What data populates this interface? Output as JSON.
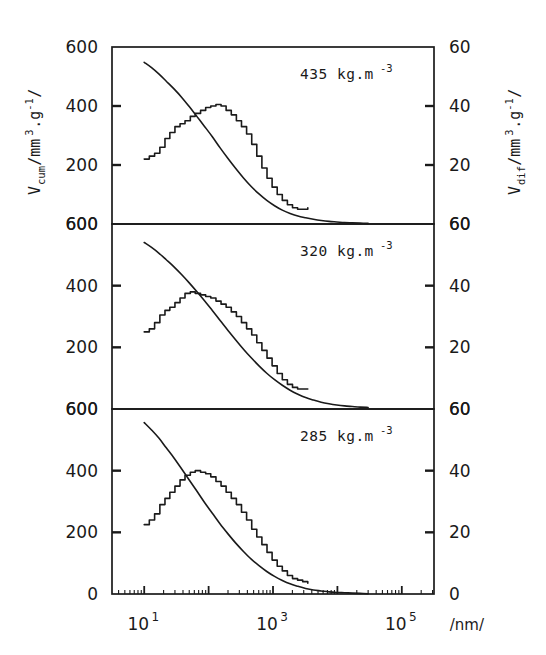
{
  "figure": {
    "axis_titles": {
      "left_main": "V",
      "left_sub": "cum",
      "left_rest": "/mm",
      "left_exp3": "3",
      "left_dot_g": ".g",
      "left_expm1": "-1",
      "left_tail": "/",
      "right_main": "V",
      "right_sub": "dif",
      "right_rest": "/mm",
      "right_exp3": "3",
      "right_dot_g": ".g",
      "right_expm1": "-1",
      "right_tail": "/",
      "x_unit": "/nm/"
    },
    "x_tick_labels": [
      {
        "mantissa": "10",
        "exponent": "1",
        "value": 10
      },
      {
        "mantissa": "10",
        "exponent": "3",
        "value": 1000
      },
      {
        "mantissa": "10",
        "exponent": "5",
        "value": 100000
      }
    ],
    "panels": [
      {
        "id": "panel-435",
        "annotation_value": "435",
        "annotation_unit": "kg.m",
        "annotation_exponent": "-3",
        "left_ticks": [
          "600",
          "400",
          "200"
        ],
        "right_ticks": [
          "60",
          "40",
          "20"
        ],
        "bottom_left_label": "600",
        "bottom_right_label": "60"
      },
      {
        "id": "panel-320",
        "annotation_value": "320",
        "annotation_unit": "kg.m",
        "annotation_exponent": "-3",
        "left_ticks": [
          "600",
          "400",
          "200"
        ],
        "right_ticks": [
          "60",
          "40",
          "20"
        ],
        "bottom_left_label": "600",
        "bottom_right_label": "60"
      },
      {
        "id": "panel-285",
        "annotation_value": "285",
        "annotation_unit": "kg.m",
        "annotation_exponent": "-3",
        "left_ticks": [
          "600",
          "400",
          "200",
          "0"
        ],
        "right_ticks": [
          "60",
          "40",
          "20",
          "0"
        ],
        "bottom_left_label": "0",
        "bottom_right_label": "0"
      }
    ]
  },
  "chart_data": {
    "type": "line",
    "title": "",
    "xlabel": "/nm/",
    "ylabel": "V_cum/mm3.g-1/",
    "ylabel_right": "V_dif/mm3.g-1/",
    "xscale": "log",
    "xlim": [
      3.16,
      316227.8
    ],
    "ylim": [
      0,
      600
    ],
    "ylim_right": [
      0,
      60
    ],
    "grid": false,
    "legend": "none",
    "xticks": [
      10,
      1000,
      100000
    ],
    "yticks_left": [
      0,
      200,
      400,
      600
    ],
    "yticks_right": [
      0,
      20,
      40,
      60
    ],
    "panels": [
      {
        "name": "435 kg.m-3",
        "density_kg_m3": 435,
        "series": [
          {
            "name": "V_cum",
            "kind": "cumulative-smooth",
            "axis": "left",
            "x": [
              10,
              13,
              17,
              22,
              29,
              38,
              50,
              66,
              87,
              115,
              151,
              200,
              264,
              348,
              459,
              606,
              800,
              1057,
              1395,
              1842,
              2432,
              3211,
              4240,
              5600,
              7395,
              9766,
              12894,
              17000,
              22500,
              30000
            ],
            "y": [
              548,
              530,
              508,
              484,
              458,
              430,
              398,
              364,
              330,
              295,
              258,
              222,
              188,
              156,
              127,
              102,
              80,
              62,
              47,
              36,
              27,
              21,
              16,
              12,
              9,
              7,
              5,
              4,
              3,
              2
            ]
          },
          {
            "name": "V_dif",
            "kind": "differential-step",
            "axis": "right",
            "x": [
              10,
              12,
              14.5,
              17.5,
              21,
              25,
              30,
              36,
              43,
              52,
              62,
              75,
              90,
              108,
              130,
              156,
              187,
              225,
              270,
              324,
              389,
              467,
              560,
              672,
              807,
              968,
              1162,
              1394,
              1673,
              2008,
              2409,
              2891,
              3469
            ],
            "y": [
              22,
              23,
              24,
              26,
              29,
              31,
              33,
              34,
              35,
              36.5,
              37.5,
              38.5,
              39.5,
              40,
              40.5,
              40,
              38.5,
              37,
              35,
              33,
              30.5,
              27,
              23,
              19,
              15.5,
              12.5,
              10,
              8,
              6.5,
              5.5,
              5,
              5,
              5.5
            ]
          }
        ]
      },
      {
        "name": "320 kg.m-3",
        "density_kg_m3": 320,
        "series": [
          {
            "name": "V_cum",
            "kind": "cumulative-smooth",
            "axis": "left",
            "x": [
              10,
              13,
              17,
              22,
              29,
              38,
              50,
              66,
              87,
              115,
              151,
              200,
              264,
              348,
              459,
              606,
              800,
              1057,
              1395,
              1842,
              2432,
              3211,
              4240,
              5600,
              7395,
              9766,
              12894,
              17000,
              22500,
              30000
            ],
            "y": [
              540,
              524,
              505,
              484,
              461,
              436,
              409,
              380,
              350,
              319,
              287,
              255,
              224,
              194,
              166,
              140,
              116,
              95,
              77,
              61,
              48,
              37,
              29,
              22,
              17,
              13,
              10,
              8,
              6,
              5
            ]
          },
          {
            "name": "V_dif",
            "kind": "differential-step",
            "axis": "right",
            "x": [
              10,
              12,
              14.5,
              17.5,
              21,
              25,
              30,
              36,
              43,
              52,
              62,
              75,
              90,
              108,
              130,
              156,
              187,
              225,
              270,
              324,
              389,
              467,
              560,
              672,
              807,
              968,
              1162,
              1394,
              1673,
              2008,
              2409,
              2891,
              3469
            ],
            "y": [
              25,
              26,
              28,
              30.5,
              32,
              33,
              34.5,
              36,
              37.5,
              38,
              37.5,
              37,
              36.5,
              36,
              35,
              34,
              33,
              31.5,
              30,
              28,
              26,
              24,
              21.5,
              19,
              16.5,
              14,
              11.5,
              9.5,
              8,
              7,
              6.5,
              6.5,
              6.5
            ]
          }
        ]
      },
      {
        "name": "285 kg.m-3",
        "density_kg_m3": 285,
        "series": [
          {
            "name": "V_cum",
            "kind": "cumulative-smooth",
            "axis": "left",
            "x": [
              10,
              13,
              17,
              22,
              29,
              38,
              50,
              66,
              87,
              115,
              151,
              200,
              264,
              348,
              459,
              606,
              800,
              1057,
              1395,
              1842,
              2432,
              3211,
              4240,
              5600,
              7395,
              9766,
              12894,
              17000,
              22500,
              30000
            ],
            "y": [
              556,
              532,
              505,
              474,
              441,
              406,
              370,
              333,
              296,
              261,
              227,
              195,
              165,
              138,
              113,
              92,
              73,
              57,
              44,
              33,
              25,
              18,
              13,
              10,
              7,
              5,
              4,
              3,
              2,
              1
            ]
          },
          {
            "name": "V_dif",
            "kind": "differential-step",
            "axis": "right",
            "x": [
              10,
              12,
              14.5,
              17.5,
              21,
              25,
              30,
              36,
              43,
              52,
              62,
              75,
              90,
              108,
              130,
              156,
              187,
              225,
              270,
              324,
              389,
              467,
              560,
              672,
              807,
              968,
              1162,
              1394,
              1673,
              2008,
              2409,
              2891,
              3469
            ],
            "y": [
              22.5,
              24,
              26,
              29,
              31,
              33,
              35,
              37,
              38.5,
              39.5,
              40,
              39.5,
              39,
              38,
              36.5,
              35,
              33,
              31,
              29,
              26.5,
              24,
              21,
              18.5,
              16,
              13.5,
              11,
              9,
              7.5,
              6,
              5,
              4.5,
              4,
              3.5
            ]
          }
        ]
      }
    ]
  }
}
